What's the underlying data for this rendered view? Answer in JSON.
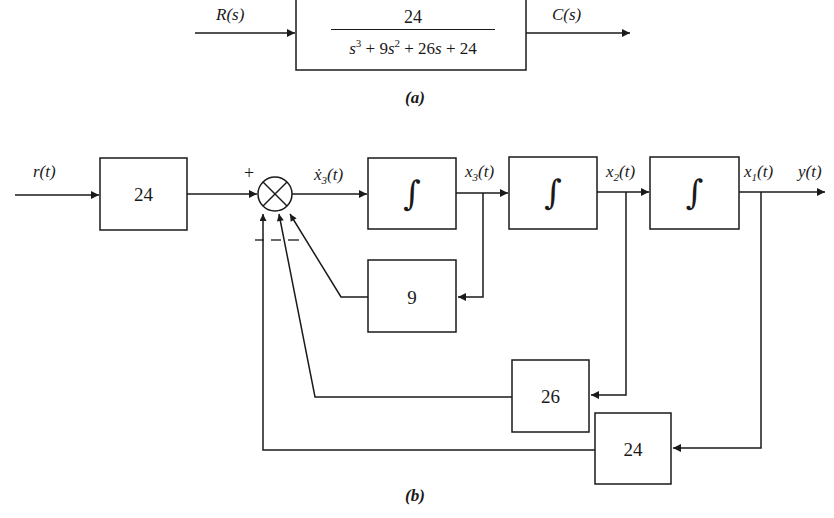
{
  "figure_a": {
    "caption": "(a)",
    "input_label": "R(s)",
    "output_label": "C(s)",
    "transfer_function": {
      "numerator": "24",
      "denominator_terms": [
        "s",
        "3",
        " + 9",
        "s",
        "2",
        " + 26",
        "s",
        " + 24"
      ],
      "denominator_text": "s^3 + 9s^2 + 26s + 24"
    }
  },
  "figure_b": {
    "caption": "(b)",
    "input_label": "r(t)",
    "output_label": "y(t)",
    "input_gain_block": "24",
    "summing_junction": {
      "plus_sign": "+",
      "minus_signs": "— — —"
    },
    "signals": {
      "x3dot": {
        "base": "ẋ",
        "sub": "3",
        "arg": "(t)"
      },
      "x3": {
        "base": "x",
        "sub": "3",
        "arg": "(t)"
      },
      "x2": {
        "base": "x",
        "sub": "2",
        "arg": "(t)"
      },
      "x1": {
        "base": "x",
        "sub": "1",
        "arg": "(t)"
      }
    },
    "integrators": [
      "∫",
      "∫",
      "∫"
    ],
    "feedback_gains": {
      "gain_x3": "9",
      "gain_x2": "26",
      "gain_x1": "24"
    }
  }
}
